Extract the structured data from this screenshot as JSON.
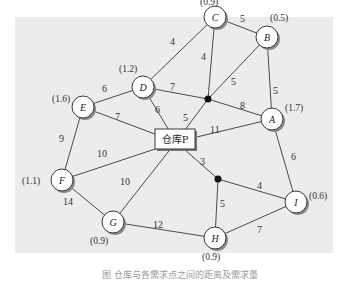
{
  "diagram": {
    "type": "weighted-network",
    "warehouse": {
      "id": "P",
      "label": "仓库P",
      "x": 176,
      "y": 142
    },
    "nodes": [
      {
        "id": "A",
        "label": "A",
        "demand": "(1.7)",
        "x": 272,
        "y": 119
      },
      {
        "id": "B",
        "label": "B",
        "demand": "(0.5)",
        "x": 267,
        "y": 37
      },
      {
        "id": "C",
        "label": "C",
        "demand": "(0.9)",
        "x": 215,
        "y": 17
      },
      {
        "id": "D",
        "label": "D",
        "demand": "(1.2)",
        "x": 143,
        "y": 87
      },
      {
        "id": "E",
        "label": "E",
        "demand": "(1.6)",
        "x": 83,
        "y": 107
      },
      {
        "id": "F",
        "label": "F",
        "demand": "(1.1)",
        "x": 62,
        "y": 180
      },
      {
        "id": "G",
        "label": "G",
        "demand": "(0.9)",
        "x": 113,
        "y": 222
      },
      {
        "id": "H",
        "label": "H",
        "demand": "(0.9)",
        "x": 215,
        "y": 238
      },
      {
        "id": "I",
        "label": "I",
        "demand": "(0.6)",
        "x": 296,
        "y": 202
      }
    ],
    "junctions": [
      {
        "id": "J1",
        "x": 208,
        "y": 99
      },
      {
        "id": "J2",
        "x": 218,
        "y": 179
      }
    ],
    "edges": [
      {
        "from": "D",
        "to": "C",
        "weight": "4"
      },
      {
        "from": "C",
        "to": "B",
        "weight": "5"
      },
      {
        "from": "C",
        "to": "J1",
        "weight": "4"
      },
      {
        "from": "D",
        "to": "J1",
        "weight": "7"
      },
      {
        "from": "B",
        "to": "J1",
        "weight": "5"
      },
      {
        "from": "B",
        "to": "A",
        "weight": "5"
      },
      {
        "from": "J1",
        "to": "A",
        "weight": "8"
      },
      {
        "from": "P",
        "to": "J1",
        "weight": "5"
      },
      {
        "from": "E",
        "to": "D",
        "weight": "6"
      },
      {
        "from": "D",
        "to": "P",
        "weight": "6"
      },
      {
        "from": "E",
        "to": "P",
        "weight": "7"
      },
      {
        "from": "P",
        "to": "A",
        "weight": "11"
      },
      {
        "from": "E",
        "to": "F",
        "weight": "9"
      },
      {
        "from": "F",
        "to": "P",
        "weight": "10"
      },
      {
        "from": "G",
        "to": "P",
        "weight": "10"
      },
      {
        "from": "F",
        "to": "G",
        "weight": "14"
      },
      {
        "from": "P",
        "to": "J2",
        "weight": "3"
      },
      {
        "from": "J2",
        "to": "I",
        "weight": "4"
      },
      {
        "from": "J2",
        "to": "H",
        "weight": "5"
      },
      {
        "from": "A",
        "to": "I",
        "weight": "6"
      },
      {
        "from": "G",
        "to": "H",
        "weight": "12"
      },
      {
        "from": "H",
        "to": "I",
        "weight": "7"
      }
    ]
  },
  "caption": "图 仓库与各需求点之间的距离及需求量"
}
